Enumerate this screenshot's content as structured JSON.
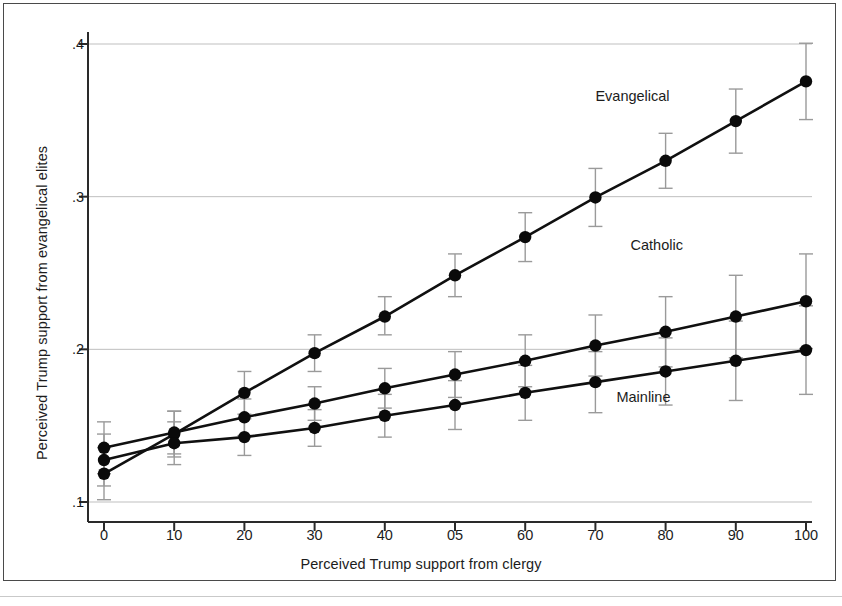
{
  "chart_data": {
    "type": "line",
    "title": "",
    "xlabel": "Perceived Trump support from clergy",
    "ylabel": "Perceived Trump support from evangelical elites",
    "x": [
      0,
      10,
      20,
      30,
      40,
      50,
      60,
      70,
      80,
      90,
      100
    ],
    "xtick_labels": [
      "0",
      "10",
      "20",
      "30",
      "40",
      "05",
      "60",
      "70",
      "80",
      "90",
      "100"
    ],
    "ytick_labels": [
      ".1",
      ".2",
      ".3",
      ".4"
    ],
    "ytick_values": [
      0.1,
      0.2,
      0.3,
      0.4
    ],
    "xlim": [
      -3,
      103
    ],
    "ylim": [
      0.088,
      0.405
    ],
    "grid": "horizontal",
    "legend_position": "inline-annotations",
    "marker": "filled-circle",
    "error_bars": true,
    "series": [
      {
        "name": "Evangelical",
        "label_x": 70,
        "label_y": 0.365,
        "values": [
          0.1185,
          0.1445,
          0.1715,
          0.1975,
          0.2215,
          0.2485,
          0.2735,
          0.2995,
          0.3235,
          0.3495,
          0.3755
        ],
        "err_low": [
          0.1015,
          0.1295,
          0.1575,
          0.1855,
          0.2095,
          0.2345,
          0.2575,
          0.2805,
          0.3055,
          0.3285,
          0.3505
        ],
        "err_high": [
          0.1355,
          0.1595,
          0.1855,
          0.2095,
          0.2345,
          0.2625,
          0.2895,
          0.3185,
          0.3415,
          0.3705,
          0.4005
        ]
      },
      {
        "name": "Catholic",
        "label_x": 75,
        "label_y": 0.268,
        "values": [
          0.1355,
          0.1455,
          0.1555,
          0.1645,
          0.1745,
          0.1835,
          0.1925,
          0.2025,
          0.2115,
          0.2215,
          0.2315
        ],
        "err_low": [
          0.1185,
          0.1315,
          0.1435,
          0.1535,
          0.1615,
          0.1685,
          0.1755,
          0.1825,
          0.1885,
          0.1945,
          0.2005
        ],
        "err_high": [
          0.1525,
          0.1595,
          0.1675,
          0.1755,
          0.1875,
          0.1985,
          0.2095,
          0.2225,
          0.2345,
          0.2485,
          0.2625
        ]
      },
      {
        "name": "Mainline",
        "label_x": 73,
        "label_y": 0.168,
        "values": [
          0.1275,
          0.1385,
          0.1425,
          0.1485,
          0.1565,
          0.1635,
          0.1715,
          0.1785,
          0.1855,
          0.1925,
          0.1995
        ],
        "err_low": [
          0.1105,
          0.1245,
          0.1305,
          0.1365,
          0.1425,
          0.1475,
          0.1535,
          0.1585,
          0.1635,
          0.1665,
          0.1705
        ],
        "err_high": [
          0.1445,
          0.1525,
          0.1545,
          0.1605,
          0.1705,
          0.1795,
          0.1895,
          0.1985,
          0.2075,
          0.2185,
          0.2285
        ]
      }
    ],
    "colors": {
      "line": "#101010",
      "marker": "#0a0a0a",
      "error_bar": "#9a9a9a",
      "gridline": "#bfbfbf",
      "axis": "#2a2a2a",
      "text": "#1c1c1c",
      "background": "#ffffff",
      "frame": "#4a4a4a"
    }
  }
}
